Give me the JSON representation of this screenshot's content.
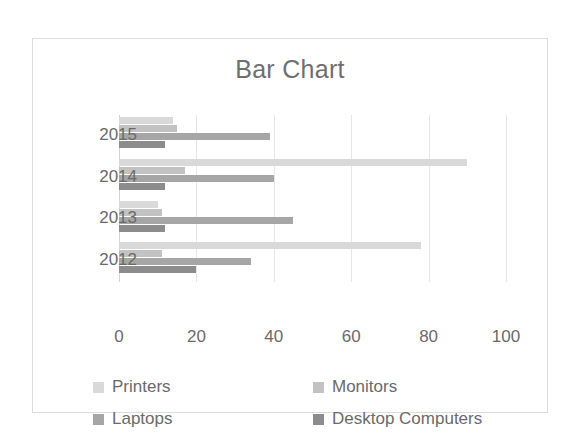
{
  "chart_data": {
    "type": "bar",
    "orientation": "horizontal",
    "title": "Bar Chart",
    "xlabel": "",
    "ylabel": "",
    "categories": [
      "2012",
      "2013",
      "2014",
      "2015"
    ],
    "category_order_top_to_bottom": [
      "2015",
      "2014",
      "2013",
      "2012"
    ],
    "series": [
      {
        "name": "Printers",
        "color": "#d9d9d9",
        "values": [
          78,
          10,
          90,
          14
        ]
      },
      {
        "name": "Monitors",
        "color": "#c2c2c2",
        "values": [
          11,
          11,
          17,
          15
        ]
      },
      {
        "name": "Laptops",
        "color": "#a6a6a6",
        "values": [
          34,
          45,
          40,
          39
        ]
      },
      {
        "name": "Desktop Computers",
        "color": "#8c8c8c",
        "values": [
          20,
          12,
          12,
          12
        ]
      }
    ],
    "xlim": [
      0,
      100
    ],
    "xticks": [
      0,
      20,
      40,
      60,
      80,
      100
    ],
    "xtick_labels": [
      "0",
      "20",
      "40",
      "60",
      "80",
      "100"
    ],
    "grid": true,
    "grid_axis": "x",
    "legend": true,
    "legend_position": "bottom",
    "background_color": "#ffffff",
    "border_color": "#dcdcdc",
    "text_color": "#6a6a6a"
  }
}
